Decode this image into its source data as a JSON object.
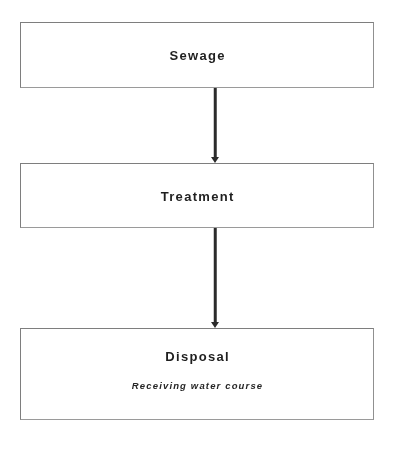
{
  "diagram": {
    "background_color": "#ffffff",
    "box_border_color": "#8a8a8a",
    "connector_color": "#2b2b2b",
    "text_color": "#1f1f1f",
    "nodes": [
      {
        "id": "sewage",
        "label": "Sewage",
        "subtitle": ""
      },
      {
        "id": "treatment",
        "label": "Treatment",
        "subtitle": ""
      },
      {
        "id": "disposal",
        "label": "Disposal",
        "subtitle": "Receiving water course"
      }
    ],
    "connectors": [
      {
        "id": "sewage-treatment",
        "from": "sewage",
        "to": "treatment",
        "arrow": "down"
      },
      {
        "id": "treatment-disposal",
        "from": "treatment",
        "to": "disposal",
        "arrow": "down"
      }
    ]
  }
}
